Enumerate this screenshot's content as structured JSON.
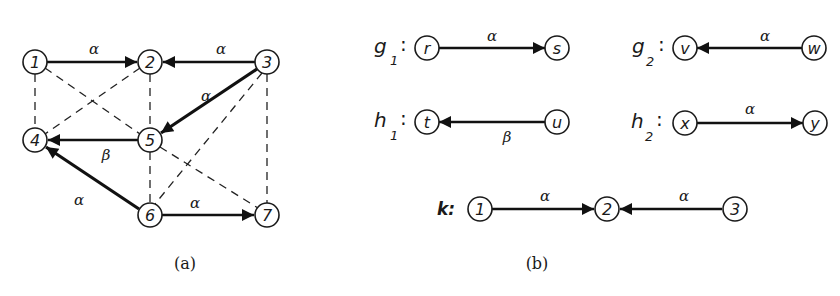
{
  "figure": {
    "panel_a": {
      "caption": "(a)",
      "nodes": [
        {
          "id": "1",
          "label": "1",
          "x": 35,
          "y": 62
        },
        {
          "id": "2",
          "label": "2",
          "x": 150,
          "y": 62
        },
        {
          "id": "3",
          "label": "3",
          "x": 267,
          "y": 62
        },
        {
          "id": "4",
          "label": "4",
          "x": 35,
          "y": 140
        },
        {
          "id": "5",
          "label": "5",
          "x": 150,
          "y": 140
        },
        {
          "id": "6",
          "label": "6",
          "x": 150,
          "y": 215
        },
        {
          "id": "7",
          "label": "7",
          "x": 267,
          "y": 215
        }
      ],
      "solid_edges": [
        {
          "from": "1",
          "to": "2",
          "label": "α",
          "weight": "normal"
        },
        {
          "from": "3",
          "to": "2",
          "label": "α",
          "weight": "normal"
        },
        {
          "from": "3",
          "to": "5",
          "label": "α",
          "weight": "thick"
        },
        {
          "from": "5",
          "to": "4",
          "label": "β",
          "weight": "normal"
        },
        {
          "from": "6",
          "to": "4",
          "label": "α",
          "weight": "thick"
        },
        {
          "from": "6",
          "to": "7",
          "label": "α",
          "weight": "normal"
        }
      ],
      "dashed_edges": [
        {
          "from": "1",
          "to": "4"
        },
        {
          "from": "1",
          "to": "5"
        },
        {
          "from": "2",
          "to": "4"
        },
        {
          "from": "2",
          "to": "5"
        },
        {
          "from": "3",
          "to": "6"
        },
        {
          "from": "3",
          "to": "7"
        },
        {
          "from": "5",
          "to": "6"
        },
        {
          "from": "5",
          "to": "7"
        }
      ]
    },
    "panel_b": {
      "caption": "(b)",
      "graphs": [
        {
          "name": "g",
          "sub": "1",
          "nodes": [
            "r",
            "s"
          ],
          "direction": "forward",
          "edge_label": "α",
          "label_pos": "above"
        },
        {
          "name": "g",
          "sub": "2",
          "nodes": [
            "v",
            "w"
          ],
          "direction": "backward",
          "edge_label": "α",
          "label_pos": "above"
        },
        {
          "name": "h",
          "sub": "1",
          "nodes": [
            "t",
            "u"
          ],
          "direction": "backward",
          "edge_label": "β",
          "label_pos": "below"
        },
        {
          "name": "h",
          "sub": "2",
          "nodes": [
            "x",
            "y"
          ],
          "direction": "forward",
          "edge_label": "α",
          "label_pos": "above"
        }
      ],
      "k": {
        "name": "k:",
        "nodes": [
          "1",
          "2",
          "3"
        ],
        "edges": [
          {
            "from": "1",
            "to": "2",
            "label": "α"
          },
          {
            "from": "3",
            "to": "2",
            "label": "α"
          }
        ]
      }
    }
  }
}
